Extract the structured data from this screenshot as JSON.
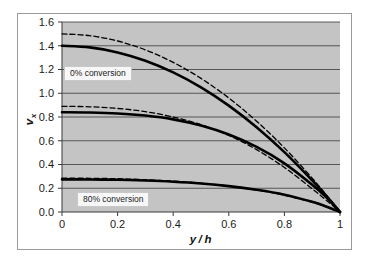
{
  "figure": {
    "background_color": "#ffffff",
    "plot_background_color": "#c4c4c4",
    "border_color": "#9a9a9a",
    "gridline_color": "#4a4a4a",
    "curve_color": "#000000"
  },
  "annotations": {
    "top_label": "0% conversion",
    "bottom_label": "80% conversion"
  },
  "axis": {
    "y_title_main": "v",
    "y_title_sub": "x",
    "x_title_num": "y",
    "x_title_slash": "/",
    "x_title_den": "h"
  },
  "ticks": {
    "y": [
      "0.0",
      "0.2",
      "0.4",
      "0.6",
      "0.8",
      "1.0",
      "1.2",
      "1.4",
      "1.6"
    ],
    "x": [
      "0",
      "0.2",
      "0.4",
      "0.6",
      "0.8",
      "1"
    ]
  },
  "chart_data": {
    "type": "line",
    "title": "",
    "xlabel": "y/h",
    "ylabel": "v_x",
    "xlim": [
      0,
      1
    ],
    "ylim": [
      0.0,
      1.6
    ],
    "xticks": [
      0,
      0.2,
      0.4,
      0.6,
      0.8,
      1
    ],
    "yticks": [
      0.0,
      0.2,
      0.4,
      0.6,
      0.8,
      1.0,
      1.2,
      1.4,
      1.6
    ],
    "grid": "horizontal",
    "legend": "none",
    "annotations": [
      {
        "text": "0% conversion",
        "x": 0.02,
        "y": 1.2
      },
      {
        "text": "80% conversion",
        "x": 0.1,
        "y": 0.12
      }
    ],
    "series": [
      {
        "name": "0% conversion - dashed",
        "style": "dashed",
        "x": [
          0,
          0.1,
          0.2,
          0.3,
          0.4,
          0.5,
          0.6,
          0.7,
          0.8,
          0.9,
          0.95,
          1.0
        ],
        "values": [
          1.5,
          1.485,
          1.44,
          1.365,
          1.26,
          1.125,
          0.96,
          0.765,
          0.54,
          0.285,
          0.146,
          0.0
        ]
      },
      {
        "name": "0% conversion - solid",
        "style": "solid",
        "x": [
          0,
          0.1,
          0.2,
          0.3,
          0.4,
          0.5,
          0.6,
          0.7,
          0.8,
          0.9,
          0.95,
          1.0
        ],
        "values": [
          1.4,
          1.386,
          1.344,
          1.274,
          1.176,
          1.05,
          0.896,
          0.714,
          0.504,
          0.266,
          0.137,
          0.0
        ]
      },
      {
        "name": "intermediate conversion - dashed",
        "style": "dashed",
        "x": [
          0,
          0.1,
          0.2,
          0.3,
          0.4,
          0.5,
          0.6,
          0.7,
          0.8,
          0.9,
          0.95,
          1.0
        ],
        "values": [
          0.89,
          0.886,
          0.872,
          0.845,
          0.8,
          0.735,
          0.645,
          0.525,
          0.375,
          0.195,
          0.1,
          0.0
        ]
      },
      {
        "name": "intermediate conversion - solid",
        "style": "solid",
        "x": [
          0,
          0.1,
          0.2,
          0.3,
          0.4,
          0.5,
          0.6,
          0.7,
          0.8,
          0.9,
          0.95,
          1.0
        ],
        "values": [
          0.84,
          0.838,
          0.83,
          0.812,
          0.78,
          0.728,
          0.652,
          0.548,
          0.41,
          0.23,
          0.125,
          0.0
        ]
      },
      {
        "name": "80% conversion - dashed",
        "style": "dashed",
        "x": [
          0,
          0.1,
          0.2,
          0.3,
          0.4,
          0.5,
          0.6,
          0.7,
          0.8,
          0.9,
          0.95,
          1.0
        ],
        "values": [
          0.285,
          0.284,
          0.28,
          0.272,
          0.26,
          0.243,
          0.218,
          0.185,
          0.142,
          0.082,
          0.045,
          0.0
        ]
      },
      {
        "name": "80% conversion - solid",
        "style": "solid",
        "x": [
          0,
          0.1,
          0.2,
          0.3,
          0.4,
          0.5,
          0.6,
          0.7,
          0.8,
          0.9,
          0.95,
          1.0
        ],
        "values": [
          0.275,
          0.274,
          0.271,
          0.265,
          0.255,
          0.24,
          0.218,
          0.187,
          0.146,
          0.086,
          0.047,
          0.0
        ]
      }
    ]
  }
}
